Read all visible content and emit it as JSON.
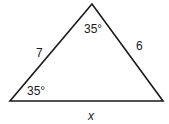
{
  "diagram": {
    "type": "triangle",
    "vertices": {
      "apex": [
        92,
        4
      ],
      "bottom_left": [
        10,
        101
      ],
      "bottom_right": [
        163,
        101
      ]
    },
    "labels": {
      "apex_angle": "35°",
      "bottom_left_angle": "35°",
      "left_side": "7",
      "right_side": "6",
      "base": "x"
    },
    "stroke_color": "#1a1a1a"
  }
}
